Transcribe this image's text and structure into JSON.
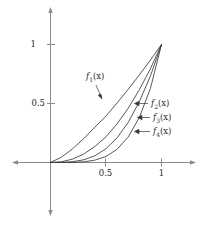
{
  "chart_data": {
    "type": "line",
    "title": "",
    "xlabel": "",
    "ylabel": "",
    "xlim": [
      -0.35,
      1.33
    ],
    "ylim": [
      -0.46,
      1.33
    ],
    "xticks": [
      0.5,
      1
    ],
    "xtick_labels": [
      "0.5",
      "1"
    ],
    "yticks": [
      0.5,
      1
    ],
    "ytick_labels": [
      "0.5",
      "1"
    ],
    "grid": false,
    "legend": "inline-annotations",
    "axis_arrows": "both-ends",
    "series": [
      {
        "name": "f_1(x)",
        "label": "f",
        "sub": "1",
        "arg": "(x)",
        "description": "least convex curve, nearly straight from (0,0) to (1,1)",
        "exponent": 1.35,
        "x": [
          0,
          0.1,
          0.2,
          0.3,
          0.4,
          0.5,
          0.6,
          0.7,
          0.8,
          0.9,
          1.0
        ],
        "y": [
          0,
          0.046,
          0.117,
          0.203,
          0.3,
          0.393,
          0.505,
          0.62,
          0.742,
          0.868,
          1.0
        ]
      },
      {
        "name": "f_2(x)",
        "label": "f",
        "sub": "2",
        "arg": "(x)",
        "description": "moderately convex curve, approximately x squared",
        "exponent": 2.2,
        "x": [
          0,
          0.1,
          0.2,
          0.3,
          0.4,
          0.5,
          0.6,
          0.7,
          0.8,
          0.9,
          1.0
        ],
        "y": [
          0,
          0.0063,
          0.029,
          0.072,
          0.136,
          0.218,
          0.328,
          0.46,
          0.616,
          0.794,
          1.0
        ]
      },
      {
        "name": "f_3(x)",
        "label": "f",
        "sub": "3",
        "arg": "(x)",
        "description": "more convex curve, approximately x cubed",
        "exponent": 3.1,
        "x": [
          0,
          0.1,
          0.2,
          0.3,
          0.4,
          0.5,
          0.6,
          0.7,
          0.8,
          0.9,
          1.0
        ],
        "y": [
          0,
          0.0008,
          0.0066,
          0.023,
          0.057,
          0.117,
          0.209,
          0.34,
          0.515,
          0.733,
          1.0
        ]
      },
      {
        "name": "f_4(x)",
        "label": "f",
        "sub": "4",
        "arg": "(x)",
        "description": "most convex curve, approximately x to the fourth power",
        "exponent": 4.3,
        "x": [
          0,
          0.1,
          0.2,
          0.3,
          0.4,
          0.5,
          0.6,
          0.7,
          0.8,
          0.9,
          1.0
        ],
        "y": [
          0,
          5e-05,
          0.001,
          0.0058,
          0.02,
          0.051,
          0.112,
          0.216,
          0.381,
          0.627,
          1.0
        ]
      }
    ],
    "annotations": [
      {
        "text": "f_1(x)",
        "label": "f",
        "sub": "1",
        "arg": "(x)",
        "arrow": "down-right"
      },
      {
        "text": "f_2(x)",
        "label": "f",
        "sub": "2",
        "arg": "(x)",
        "arrow": "left"
      },
      {
        "text": "f_3(x)",
        "label": "f",
        "sub": "3",
        "arg": "(x)",
        "arrow": "left"
      },
      {
        "text": "f_4(x)",
        "label": "f",
        "sub": "4",
        "arg": "(x)",
        "arrow": "left"
      }
    ],
    "colors": {
      "axis": "#808080",
      "curve": "#3a3a3a",
      "text": "#2b2b2b",
      "background": "#ffffff"
    }
  },
  "labels": {
    "y_tick_1": "1",
    "y_tick_05": "0.5",
    "x_tick_05": "0.5",
    "x_tick_1": "1",
    "f1_name": "f",
    "f1_sub": "1",
    "f1_arg": "(x)",
    "f2_name": "f",
    "f2_sub": "2",
    "f2_arg": "(x)",
    "f3_name": "f",
    "f3_sub": "3",
    "f3_arg": "(x)",
    "f4_name": "f",
    "f4_sub": "4",
    "f4_arg": "(x)"
  }
}
